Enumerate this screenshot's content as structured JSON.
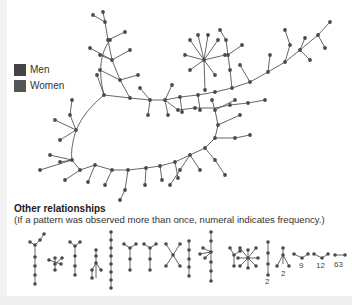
{
  "legend": {
    "items": [
      {
        "label": "Men",
        "color": "#444444"
      },
      {
        "label": "Women",
        "color": "#555555"
      }
    ]
  },
  "colors": {
    "node": "#4a4a4a",
    "edge": "#555555"
  },
  "other_relationships": {
    "title": "Other relationships",
    "subtitle": "(If a pattern was observed more than once, numeral indicates frequency.)",
    "frequency_labels": [
      "2",
      "2",
      "9",
      "12",
      "63"
    ]
  }
}
